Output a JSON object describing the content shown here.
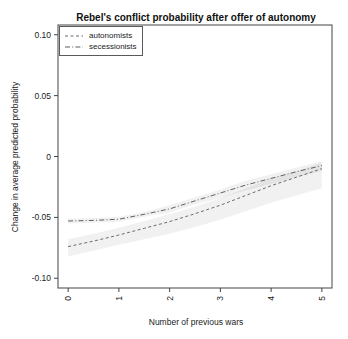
{
  "chart_data": {
    "type": "line",
    "title": "Rebel's conflict probability after offer of autonomy",
    "xlabel": "Number of previous wars",
    "ylabel": "Change in average predicted probability",
    "xlim": [
      -0.2,
      5.2
    ],
    "ylim": [
      -0.108,
      0.108
    ],
    "grid": false,
    "x_ticks": {
      "values": [
        0,
        1,
        2,
        3,
        4,
        5
      ],
      "labels": [
        "0",
        "1",
        "2",
        "3",
        "4",
        "5"
      ]
    },
    "y_ticks": {
      "values": [
        0.1,
        0.05,
        0,
        -0.05,
        -0.1
      ],
      "labels": [
        "0.10",
        "0.05",
        "0",
        "-0.05",
        "-0.10"
      ]
    },
    "x": [
      0,
      0.5,
      1,
      1.5,
      2,
      2.5,
      3,
      3.5,
      4,
      4.5,
      5
    ],
    "series": [
      {
        "name": "autonomists",
        "line_style": "dashed",
        "color": "#6b6b6b",
        "y": [
          -0.074,
          -0.0695,
          -0.0645,
          -0.059,
          -0.0535,
          -0.047,
          -0.04,
          -0.032,
          -0.024,
          -0.017,
          -0.01
        ],
        "band_upper": [
          -0.068,
          -0.0635,
          -0.0585,
          -0.053,
          -0.0475,
          -0.041,
          -0.034,
          -0.026,
          -0.018,
          -0.012,
          -0.005
        ],
        "band_lower": [
          -0.082,
          -0.0775,
          -0.0725,
          -0.068,
          -0.0635,
          -0.058,
          -0.052,
          -0.045,
          -0.038,
          -0.032,
          -0.026
        ]
      },
      {
        "name": "secessionists",
        "line_style": "dashdot",
        "color": "#5f5f5f",
        "y": [
          -0.053,
          -0.0525,
          -0.0515,
          -0.0475,
          -0.043,
          -0.0365,
          -0.03,
          -0.0235,
          -0.018,
          -0.0125,
          -0.0075
        ],
        "band_upper": [
          -0.051,
          -0.0505,
          -0.0495,
          -0.0455,
          -0.04,
          -0.0335,
          -0.027,
          -0.02,
          -0.0145,
          -0.009,
          -0.004
        ],
        "band_lower": [
          -0.055,
          -0.0545,
          -0.0535,
          -0.0495,
          -0.046,
          -0.0395,
          -0.034,
          -0.028,
          -0.0225,
          -0.017,
          -0.012
        ]
      }
    ],
    "band_color": "rgba(0,0,0,0.055)",
    "legend": {
      "position": "top-left"
    }
  }
}
